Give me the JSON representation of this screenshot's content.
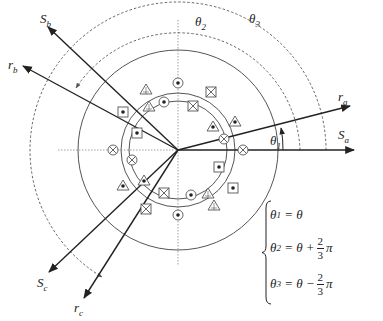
{
  "diagram": {
    "colors": {
      "line": "#222222",
      "dashed": "#555555",
      "circle": "#555555"
    },
    "center": {
      "x": 178,
      "y": 150
    },
    "labels": {
      "Sa": {
        "main": "S",
        "sub": "a"
      },
      "Sb": {
        "main": "S",
        "sub": "b"
      },
      "Sc": {
        "main": "S",
        "sub": "c"
      },
      "ra": {
        "main": "r",
        "sub": "a"
      },
      "rb": {
        "main": "r",
        "sub": "b"
      },
      "rc": {
        "main": "r",
        "sub": "c"
      },
      "theta1": {
        "main": "θ",
        "sub": "1"
      },
      "theta2": {
        "main": "θ",
        "sub": "2"
      },
      "theta3": {
        "main": "θ",
        "sub": "3"
      }
    },
    "conductor_symbols": [
      "dot-in-circle",
      "cross-in-circle",
      "dot-in-square",
      "cross-in-square",
      "dot-in-triangle",
      "cross-in-triangle"
    ]
  },
  "equations": [
    {
      "lhs_main": "θ",
      "lhs_sub": "1",
      "rhs": "= θ",
      "op": "",
      "num": "",
      "den": "",
      "tail": ""
    },
    {
      "lhs_main": "θ",
      "lhs_sub": "2",
      "rhs": "= θ",
      "op": "+",
      "num": "2",
      "den": "3",
      "tail": "π"
    },
    {
      "lhs_main": "θ",
      "lhs_sub": "3",
      "rhs": "= θ",
      "op": "−",
      "num": "2",
      "den": "3",
      "tail": "π"
    }
  ]
}
